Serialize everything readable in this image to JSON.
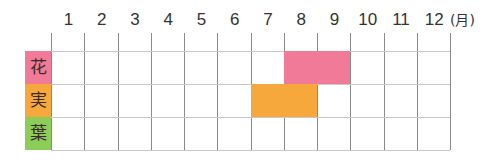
{
  "header": {
    "months": [
      "1",
      "2",
      "3",
      "4",
      "5",
      "6",
      "7",
      "8",
      "9",
      "10",
      "11",
      "12"
    ],
    "unit": "(月)"
  },
  "rows": [
    {
      "label": "花",
      "color": "#f07a97",
      "months": [
        8,
        9
      ]
    },
    {
      "label": "実",
      "color": "#f7a83d",
      "months": [
        7,
        8
      ]
    },
    {
      "label": "葉",
      "color": "#8ccd58",
      "months": []
    }
  ],
  "chart_data": {
    "type": "table",
    "title": "",
    "xlabel": "(月)",
    "categories": [
      "1",
      "2",
      "3",
      "4",
      "5",
      "6",
      "7",
      "8",
      "9",
      "10",
      "11",
      "12"
    ],
    "series": [
      {
        "name": "花",
        "color": "#f07a97",
        "active_months": [
          8,
          9
        ]
      },
      {
        "name": "実",
        "color": "#f7a83d",
        "active_months": [
          7,
          8
        ]
      },
      {
        "name": "葉",
        "color": "#8ccd58",
        "active_months": []
      }
    ],
    "grid": true
  }
}
